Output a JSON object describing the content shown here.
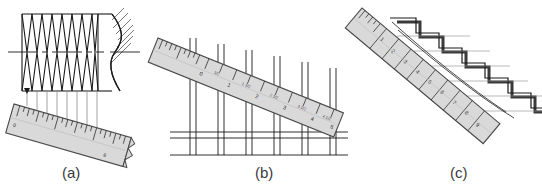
{
  "figure": {
    "type": "technical-drawing",
    "panel_count": 3,
    "background_color": "#ffffff",
    "line_color": "#1a1a1a",
    "ruler_fill": "#d9d9d9",
    "ruler_edge": "#555555",
    "construction_line_color": "#8a8a8a"
  },
  "panels": [
    {
      "id": "a",
      "caption": "(a)",
      "subject": "screw-thread-pitch-measurement",
      "ruler": {
        "label_start": "0",
        "label_end": "6",
        "tick_count": 48
      },
      "thread": {
        "crest_count": 8,
        "has_centerline": true,
        "has_break_hatching": true
      },
      "projector_count": 8
    },
    {
      "id": "b",
      "caption": "(b)",
      "subject": "equal-stud-spacing-layout",
      "ruler": {
        "labels": [
          "0",
          "1",
          "2",
          "3",
          "4",
          "5"
        ],
        "half_labels": [
          "1/2",
          "1 1/2",
          "2 1/2",
          "3 1/2",
          "4 1/2"
        ],
        "tick_count": 40
      },
      "studs": {
        "count": 6,
        "has_bottom_plate": true
      }
    },
    {
      "id": "c",
      "caption": "(c)",
      "subject": "stair-tread-riser-layout",
      "ruler": {
        "labels": [
          "0",
          "1",
          "2",
          "3",
          "4",
          "5",
          "6",
          "7",
          "8",
          "9",
          "10"
        ],
        "tick_count": 36
      },
      "stairs": {
        "step_count": 8,
        "has_projection_lines": true
      }
    }
  ]
}
